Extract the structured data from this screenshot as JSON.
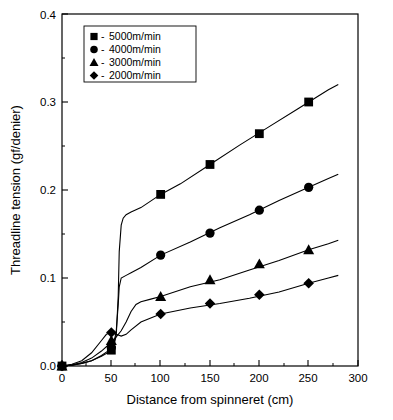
{
  "chart_data": {
    "type": "line",
    "title": "",
    "xlabel": "Distance from spinneret (cm)",
    "ylabel": "Threadline tension (gf/denier)",
    "xlim": [
      0,
      300
    ],
    "ylim": [
      0,
      0.4
    ],
    "xticks": [
      "0",
      "50",
      "100",
      "150",
      "200",
      "250",
      "300"
    ],
    "yticks": [
      "0.0",
      "0.1",
      "0.2",
      "0.3",
      "0.4"
    ],
    "grid": false,
    "legend_position": "top-left",
    "series": [
      {
        "name": "5000m/min",
        "marker": "square",
        "x": [
          0,
          50,
          100,
          150,
          200,
          250
        ],
        "values": [
          0.0,
          0.018,
          0.195,
          0.229,
          0.264,
          0.3
        ],
        "curve_x": [
          0,
          10,
          20,
          30,
          40,
          48,
          52,
          55,
          57,
          58,
          60,
          62,
          65,
          70,
          80,
          100,
          120,
          150,
          180,
          210,
          240,
          270,
          280
        ],
        "curve_y": [
          0.0,
          0.001,
          0.003,
          0.006,
          0.011,
          0.016,
          0.02,
          0.035,
          0.08,
          0.13,
          0.16,
          0.168,
          0.172,
          0.175,
          0.18,
          0.195,
          0.207,
          0.229,
          0.251,
          0.272,
          0.293,
          0.314,
          0.32
        ]
      },
      {
        "name": "4000m/min",
        "marker": "circle",
        "x": [
          0,
          50,
          100,
          150,
          200,
          250
        ],
        "values": [
          0.0,
          0.021,
          0.126,
          0.151,
          0.177,
          0.203
        ],
        "curve_x": [
          0,
          10,
          20,
          30,
          40,
          48,
          52,
          55,
          57,
          58,
          60,
          65,
          70,
          80,
          100,
          130,
          160,
          190,
          220,
          250,
          270,
          280
        ],
        "curve_y": [
          0.0,
          0.001,
          0.003,
          0.006,
          0.012,
          0.018,
          0.022,
          0.04,
          0.07,
          0.09,
          0.1,
          0.103,
          0.106,
          0.112,
          0.126,
          0.141,
          0.157,
          0.172,
          0.188,
          0.203,
          0.213,
          0.218
        ]
      },
      {
        "name": "3000m/min",
        "marker": "triangle",
        "x": [
          0,
          50,
          100,
          150,
          200,
          250
        ],
        "values": [
          0.0,
          0.029,
          0.079,
          0.098,
          0.116,
          0.132
        ],
        "curve_x": [
          0,
          10,
          20,
          30,
          40,
          48,
          55,
          60,
          65,
          70,
          75,
          80,
          90,
          100,
          130,
          160,
          190,
          220,
          250,
          270,
          280
        ],
        "curve_y": [
          0.0,
          0.001,
          0.004,
          0.009,
          0.017,
          0.025,
          0.033,
          0.04,
          0.05,
          0.062,
          0.07,
          0.073,
          0.076,
          0.079,
          0.09,
          0.098,
          0.109,
          0.12,
          0.132,
          0.139,
          0.143
        ]
      },
      {
        "name": "2000m/min",
        "marker": "diamond",
        "x": [
          0,
          50,
          100,
          150,
          200,
          250
        ],
        "values": [
          0.0,
          0.038,
          0.059,
          0.071,
          0.081,
          0.094
        ],
        "curve_x": [
          0,
          10,
          20,
          30,
          40,
          45,
          50,
          55,
          60,
          65,
          70,
          80,
          100,
          130,
          160,
          190,
          220,
          250,
          270,
          280
        ],
        "curve_y": [
          0.0,
          0.002,
          0.006,
          0.015,
          0.029,
          0.036,
          0.038,
          0.036,
          0.034,
          0.036,
          0.041,
          0.05,
          0.059,
          0.066,
          0.071,
          0.077,
          0.084,
          0.094,
          0.1,
          0.103
        ]
      }
    ]
  },
  "legend": {
    "items": [
      {
        "marker": "square",
        "dash": "-",
        "label": "5000m/min"
      },
      {
        "marker": "circle",
        "dash": "-",
        "label": "4000m/min"
      },
      {
        "marker": "triangle",
        "dash": "-",
        "label": "3000m/min"
      },
      {
        "marker": "diamond",
        "dash": "-",
        "label": "2000m/min"
      }
    ]
  },
  "colors": {
    "axis": "#000000",
    "series": "#000000",
    "background": "#ffffff"
  }
}
